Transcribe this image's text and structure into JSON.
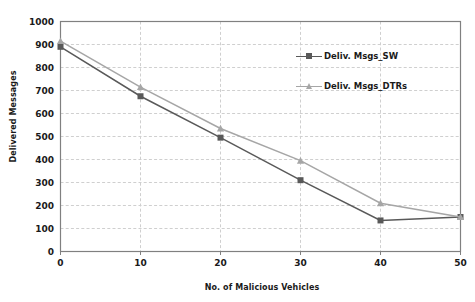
{
  "chart_data": {
    "type": "line",
    "title": "",
    "xlabel": "No. of Malicious Vehicles",
    "ylabel": "Delivered Messages",
    "x": [
      0,
      10,
      20,
      30,
      40,
      50
    ],
    "xlim": [
      0,
      50
    ],
    "ylim": [
      0,
      1000
    ],
    "x_ticks": [
      "0",
      "10",
      "20",
      "30",
      "40",
      "50"
    ],
    "y_ticks": [
      "0",
      "100",
      "200",
      "300",
      "400",
      "500",
      "600",
      "700",
      "800",
      "900",
      "1000"
    ],
    "grid": "horizontal-and-vertical-dashed",
    "legend_position": "upper-right-inside",
    "series": [
      {
        "name": "Deliv. Msgs_SW",
        "color": "#595959",
        "marker": "square",
        "values": [
          890,
          675,
          495,
          310,
          135,
          150
        ]
      },
      {
        "name": "Deliv. Msgs_DTRs",
        "color": "#a6a6a6",
        "marker": "triangle",
        "values": [
          915,
          715,
          535,
          395,
          210,
          150
        ]
      }
    ]
  },
  "legend": {
    "items": [
      {
        "label": "Deliv. Msgs_SW"
      },
      {
        "label": "Deliv. Msgs_DTRs"
      }
    ]
  },
  "colors": {
    "series_sw": "#595959",
    "series_dtrs": "#a6a6a6",
    "grid": "#cfcfcf",
    "axis": "#808080",
    "text": "#1a1a1a",
    "background": "#ffffff"
  }
}
